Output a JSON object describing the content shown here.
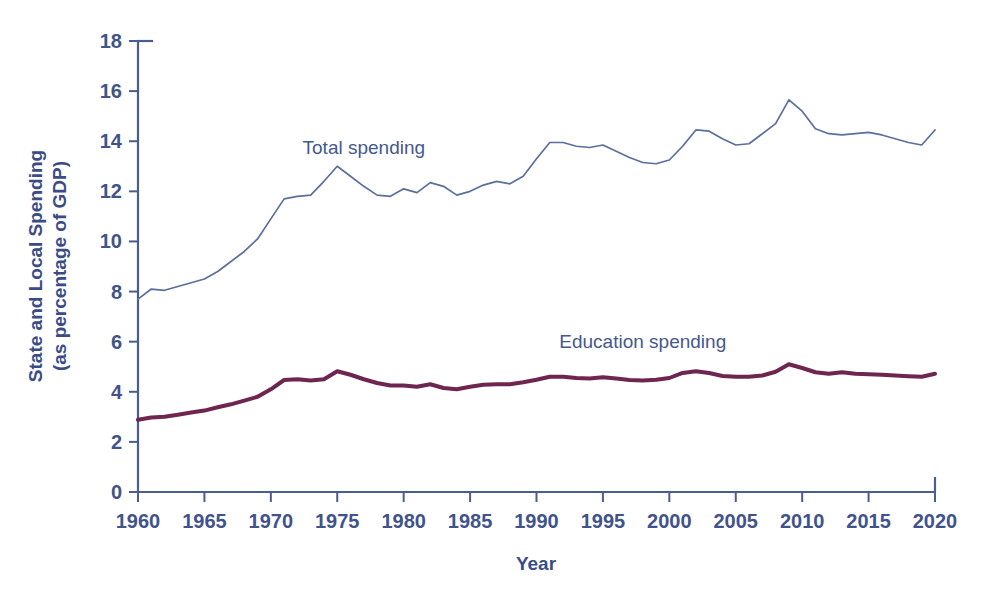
{
  "chart_data": {
    "type": "line",
    "title": "",
    "xlabel": "Year",
    "ylabel": "State and Local Spending (as percentage of GDP)",
    "ylabel_line1": "State and Local Spending",
    "ylabel_line2": "(as percentage of GDP)",
    "xlim": [
      1960,
      2020
    ],
    "ylim": [
      0,
      18
    ],
    "xticks": [
      1960,
      1965,
      1970,
      1975,
      1980,
      1985,
      1990,
      1995,
      2000,
      2005,
      2010,
      2015,
      2020
    ],
    "yticks": [
      0,
      2,
      4,
      6,
      8,
      10,
      12,
      14,
      16,
      18
    ],
    "xtick_labels": [
      "1960",
      "1965",
      "1970",
      "1975",
      "1980",
      "1985",
      "1990",
      "1995",
      "2000",
      "2005",
      "2010",
      "2015",
      "2020"
    ],
    "ytick_labels": [
      "0",
      "2",
      "4",
      "6",
      "8",
      "10",
      "12",
      "14",
      "16",
      "18"
    ],
    "grid": false,
    "legend_position": "inline-annotations",
    "x": [
      1960,
      1961,
      1962,
      1963,
      1964,
      1965,
      1966,
      1967,
      1968,
      1969,
      1970,
      1971,
      1972,
      1973,
      1974,
      1975,
      1976,
      1977,
      1978,
      1979,
      1980,
      1981,
      1982,
      1983,
      1984,
      1985,
      1986,
      1987,
      1988,
      1989,
      1990,
      1991,
      1992,
      1993,
      1994,
      1995,
      1996,
      1997,
      1998,
      1999,
      2000,
      2001,
      2002,
      2003,
      2004,
      2005,
      2006,
      2007,
      2008,
      2009,
      2010,
      2011,
      2012,
      2013,
      2014,
      2015,
      2016,
      2017,
      2018,
      2019,
      2020
    ],
    "series": [
      {
        "name": "Total spending",
        "color": "#5b6f9c",
        "label_x": 1977,
        "label_y": 13.5,
        "values": [
          7.7,
          8.1,
          8.05,
          8.2,
          8.35,
          8.5,
          8.8,
          9.2,
          9.6,
          10.1,
          10.9,
          11.7,
          11.8,
          11.85,
          12.4,
          13.0,
          12.6,
          12.2,
          11.85,
          11.8,
          12.1,
          11.95,
          12.35,
          12.2,
          11.85,
          12.0,
          12.25,
          12.4,
          12.3,
          12.6,
          13.3,
          13.95,
          13.95,
          13.8,
          13.75,
          13.85,
          13.6,
          13.35,
          13.15,
          13.1,
          13.25,
          13.8,
          14.45,
          14.4,
          14.1,
          13.85,
          13.9,
          14.3,
          14.7,
          15.65,
          15.2,
          14.5,
          14.3,
          14.25,
          14.3,
          14.35,
          14.25,
          14.1,
          13.95,
          13.85,
          14.45
        ]
      },
      {
        "name": "Education spending",
        "color": "#6e2550",
        "label_x": 1998,
        "label_y": 5.75,
        "values": [
          2.88,
          2.97,
          3.0,
          3.08,
          3.17,
          3.25,
          3.38,
          3.5,
          3.65,
          3.8,
          4.1,
          4.47,
          4.5,
          4.45,
          4.5,
          4.82,
          4.68,
          4.5,
          4.35,
          4.25,
          4.25,
          4.2,
          4.3,
          4.15,
          4.1,
          4.2,
          4.28,
          4.3,
          4.3,
          4.38,
          4.48,
          4.6,
          4.6,
          4.55,
          4.53,
          4.58,
          4.53,
          4.47,
          4.45,
          4.48,
          4.55,
          4.75,
          4.82,
          4.75,
          4.63,
          4.6,
          4.6,
          4.65,
          4.8,
          5.1,
          4.95,
          4.78,
          4.72,
          4.78,
          4.72,
          4.7,
          4.68,
          4.65,
          4.62,
          4.6,
          4.72
        ]
      }
    ]
  }
}
